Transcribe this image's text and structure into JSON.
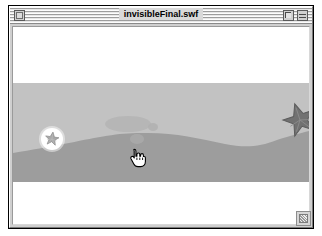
{
  "window": {
    "title": "invisibleFinal.swf",
    "close_box": "close-box",
    "zoom_box": "zoom-box",
    "collapse_box": "collapse-box",
    "grow_box": "grow-box"
  },
  "stage": {
    "name": "flash-movie-stage",
    "background_color": "#ffffff",
    "sky_color": "#ffffff",
    "sand_color": "#c2c2c2",
    "wave_color": "#9d9d9d",
    "sand_band": {
      "top": 56,
      "bottom": 155
    },
    "wave": {
      "label": "wave-shape",
      "color": "#9d9d9d",
      "points": "0,126 40,121 80,114 120,108 160,107 200,114 235,119 270,112 298,105"
    },
    "objects": [
      {
        "name": "starfish-large",
        "label": "starfish",
        "color": "#6e6e6e",
        "outline": "#5a5a5a",
        "x": 272,
        "y": 78,
        "size": 30,
        "rotation": -18,
        "state": "visible"
      },
      {
        "name": "starfish-found",
        "label": "starfish",
        "color": "#9a9a9a",
        "glow_color": "#ffffff",
        "x": 39,
        "y": 112,
        "size": 13,
        "glow_size": 21,
        "state": "revealed"
      },
      {
        "name": "hidden-object-blob",
        "label": "hidden-object",
        "color": "#b1b1b1",
        "x": 92,
        "y": 90,
        "width": 46,
        "height": 15,
        "state": "invisible"
      },
      {
        "name": "hidden-object-dot-a",
        "label": "hidden-object",
        "color": "#aeaeae",
        "x": 135,
        "y": 96,
        "width": 10,
        "height": 8,
        "state": "invisible"
      },
      {
        "name": "hidden-object-dot-b",
        "label": "hidden-object",
        "color": "#a9a9a9",
        "x": 118,
        "y": 107,
        "width": 13,
        "height": 10,
        "state": "invisible"
      }
    ],
    "cursor": {
      "name": "pointing-hand-cursor",
      "x": 116,
      "y": 121
    }
  }
}
